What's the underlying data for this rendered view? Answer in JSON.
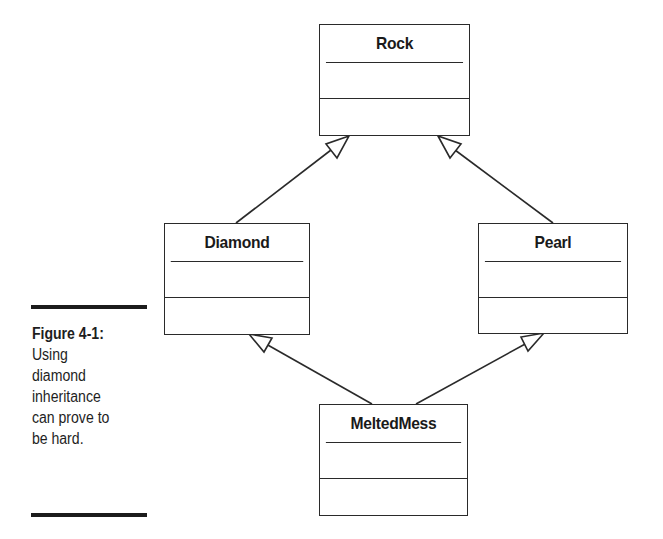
{
  "diagram": {
    "type": "UML class diagram",
    "classes": [
      {
        "id": "rock",
        "name": "Rock"
      },
      {
        "id": "diamond",
        "name": "Diamond"
      },
      {
        "id": "pearl",
        "name": "Pearl"
      },
      {
        "id": "meltedmess",
        "name": "MeltedMess"
      }
    ],
    "relations": [
      {
        "from": "Diamond",
        "to": "Rock",
        "kind": "inheritance"
      },
      {
        "from": "Pearl",
        "to": "Rock",
        "kind": "inheritance"
      },
      {
        "from": "MeltedMess",
        "to": "Diamond",
        "kind": "inheritance"
      },
      {
        "from": "MeltedMess",
        "to": "Pearl",
        "kind": "inheritance"
      }
    ]
  },
  "caption": {
    "label": "Figure 4-1:",
    "lines": [
      "Using",
      "diamond",
      "inheritance",
      "can prove to",
      "be hard."
    ]
  }
}
